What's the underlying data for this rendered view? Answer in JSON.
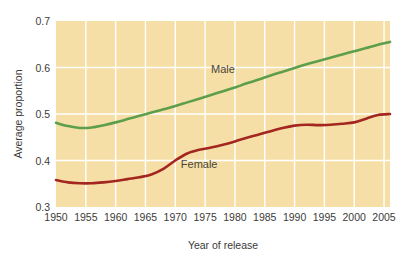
{
  "chart_data": {
    "type": "line",
    "title": "",
    "xlabel": "Year of release",
    "ylabel": "Average proportion",
    "xlim": [
      1950,
      2006
    ],
    "ylim": [
      0.3,
      0.7
    ],
    "xticks": [
      1950,
      1955,
      1960,
      1965,
      1970,
      1975,
      1980,
      1985,
      1990,
      1995,
      2000,
      2005
    ],
    "xtick_labels": [
      "1950",
      "1955",
      "1960",
      "1965",
      "1970",
      "1975",
      "1980",
      "1985",
      "1990",
      "1995",
      "2000",
      "2005"
    ],
    "yticks": [
      0.3,
      0.4,
      0.5,
      0.6,
      0.7
    ],
    "ytick_labels": [
      "0.3",
      "0.4",
      "0.5",
      "0.6",
      "0.7"
    ],
    "grid": true,
    "grid_color": "#ffffff",
    "plot_background": "#f6dfa6",
    "legend_position": "inline-annotation",
    "x": [
      1950,
      1952,
      1954,
      1956,
      1958,
      1960,
      1962,
      1964,
      1966,
      1968,
      1970,
      1972,
      1974,
      1976,
      1978,
      1980,
      1982,
      1984,
      1986,
      1988,
      1990,
      1992,
      1994,
      1996,
      1998,
      2000,
      2002,
      2004,
      2006
    ],
    "series": [
      {
        "name": "Male",
        "color": "#5d9e4a",
        "label": "Male",
        "values": [
          0.481,
          0.474,
          0.47,
          0.471,
          0.476,
          0.482,
          0.489,
          0.496,
          0.503,
          0.51,
          0.517,
          0.525,
          0.533,
          0.541,
          0.549,
          0.557,
          0.566,
          0.574,
          0.583,
          0.591,
          0.599,
          0.607,
          0.614,
          0.621,
          0.628,
          0.635,
          0.642,
          0.649,
          0.655
        ]
      },
      {
        "name": "Female",
        "color": "#a32621",
        "label": "Female",
        "values": [
          0.358,
          0.353,
          0.351,
          0.351,
          0.353,
          0.356,
          0.36,
          0.364,
          0.37,
          0.382,
          0.4,
          0.415,
          0.423,
          0.428,
          0.434,
          0.441,
          0.449,
          0.456,
          0.463,
          0.47,
          0.475,
          0.477,
          0.476,
          0.477,
          0.479,
          0.482,
          0.49,
          0.498,
          0.5
        ]
      }
    ],
    "annotations": [
      {
        "text": "Male",
        "x": 1978,
        "y": 0.588
      },
      {
        "text": "Female",
        "x": 1974,
        "y": 0.383
      }
    ]
  }
}
